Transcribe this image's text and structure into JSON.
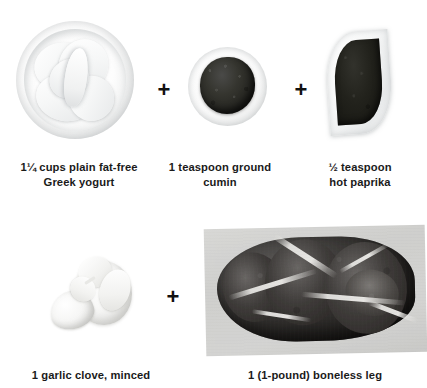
{
  "page": {
    "kind": "recipe-ingredient-collage",
    "background_color": "#ffffff",
    "text_color": "#1a1a1a",
    "plus_symbol": "+"
  },
  "rows": [
    {
      "name": "row-1",
      "items": [
        {
          "name": "greek-yogurt",
          "image_name": "bowl-of-greek-yogurt",
          "caption": "1¼ cups plain fat-free\nGreek yogurt"
        },
        {
          "name": "ground-cumin",
          "image_name": "bowl-of-ground-cumin",
          "caption": "1 teaspoon ground\ncumin"
        },
        {
          "name": "hot-paprika",
          "image_name": "leaf-dish-of-hot-paprika",
          "caption": "½ teaspoon\nhot paprika"
        }
      ],
      "separators": [
        "+",
        "+"
      ]
    },
    {
      "name": "row-2",
      "items": [
        {
          "name": "garlic-clove",
          "image_name": "garlic-bulb-and-clove",
          "caption": "1 garlic clove, minced"
        },
        {
          "name": "boneless-leg",
          "image_name": "photo-of-boneless-leg-of-lamb",
          "caption": "1 (1-pound) boneless leg"
        }
      ],
      "separators": [
        "+"
      ]
    }
  ]
}
